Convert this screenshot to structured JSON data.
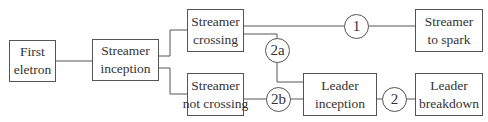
{
  "diagram": {
    "nodes": {
      "first_electron": {
        "line1": "First",
        "line2": "eletron"
      },
      "streamer_inception": {
        "line1": "Streamer",
        "line2": "inception"
      },
      "streamer_crossing": {
        "line1": "Streamer",
        "line2": "crossing"
      },
      "streamer_not_crossing": {
        "line1": "Streamer",
        "line2": "not crossing"
      },
      "streamer_to_spark": {
        "line1": "Streamer",
        "line2": "to spark"
      },
      "leader_inception": {
        "line1": "Leader",
        "line2": "inception"
      },
      "leader_breakdown": {
        "line1": "Leader",
        "line2": "breakdown"
      }
    },
    "markers": {
      "m1": "1",
      "m2a": "2a",
      "m2b": "2b",
      "m2": "2"
    },
    "edges": [
      {
        "from": "First eletron",
        "to": "Streamer inception"
      },
      {
        "from": "Streamer inception",
        "to": "Streamer crossing"
      },
      {
        "from": "Streamer inception",
        "to": "Streamer not crossing"
      },
      {
        "from": "Streamer crossing",
        "to": "Streamer to spark",
        "via": "1"
      },
      {
        "from": "Streamer crossing",
        "to": "Leader inception",
        "via": "2a"
      },
      {
        "from": "Streamer not crossing",
        "to": "Leader inception",
        "via": "2b"
      },
      {
        "from": "Leader inception",
        "to": "Leader breakdown",
        "via": "2"
      }
    ]
  }
}
